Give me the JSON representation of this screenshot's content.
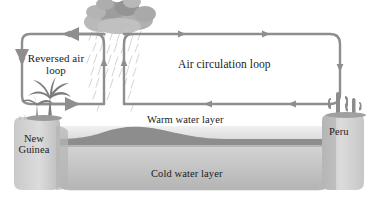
{
  "figure": {
    "title_alt": "Walker circulation diagram with reversed air loop",
    "background_color": "#ffffff",
    "arrow_color": "#8e8e8e",
    "text_color": "#1b1b1b"
  },
  "labels": {
    "reversed_air_loop": "Reversed air\nloop",
    "air_circulation_loop": "Air circulation loop",
    "warm_water_layer": "Warm water layer",
    "cold_water_layer": "Cold water layer",
    "new_guinea": "New\nGuinea",
    "peru": "Peru"
  },
  "icons": {
    "cloud": "rain-cloud-icon",
    "rain": "rainfall-icon",
    "palm": "palm-tree-icon",
    "cactus": "cactus-icon"
  },
  "colors": {
    "arrow": "#8e8e8e",
    "cloud_dark": "#9a9a9a",
    "cloud_light": "#c3c3c3",
    "rain": "#cfcfcf",
    "land_light": "#d2d2d2",
    "land_dark": "#a8a8a8",
    "warm_water": "#e6e6e6",
    "cold_water": "#c9c9c9",
    "seafloor": "#8d8d8d",
    "frame": "#eeeeee",
    "vegetation": "#7d7d7d"
  }
}
